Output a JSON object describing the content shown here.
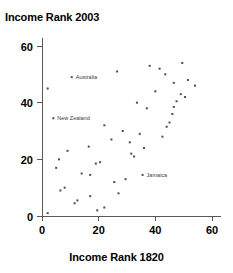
{
  "chart_data": {
    "type": "scatter",
    "title": "",
    "ylabel": "Income Rank 2003",
    "xlabel": "Income Rank 1820",
    "xlim": [
      -3,
      63
    ],
    "ylim": [
      -3,
      63
    ],
    "xticks": [
      0,
      20,
      40,
      60
    ],
    "yticks": [
      0,
      20,
      40,
      60
    ],
    "xtick_labels": [
      "0",
      "20",
      "40",
      "60"
    ],
    "ytick_labels": [
      "0",
      "20",
      "40",
      "60"
    ],
    "grid": false,
    "legend": "none",
    "points": [
      {
        "x": 2.0,
        "y": 45.0,
        "label": ""
      },
      {
        "x": 2.0,
        "y": 1.0,
        "label": ""
      },
      {
        "x": 4.0,
        "y": 34.5,
        "label": "New Zealand"
      },
      {
        "x": 5.0,
        "y": 17.0,
        "label": ""
      },
      {
        "x": 6.0,
        "y": 20.0,
        "label": ""
      },
      {
        "x": 6.5,
        "y": 9.0,
        "label": ""
      },
      {
        "x": 8.0,
        "y": 10.0,
        "label": ""
      },
      {
        "x": 9.0,
        "y": 23.0,
        "label": ""
      },
      {
        "x": 10.5,
        "y": 49.0,
        "label": "Australia"
      },
      {
        "x": 11.5,
        "y": 4.5,
        "label": ""
      },
      {
        "x": 12.5,
        "y": 5.5,
        "label": ""
      },
      {
        "x": 14.0,
        "y": 15.0,
        "label": ""
      },
      {
        "x": 16.5,
        "y": 24.5,
        "label": ""
      },
      {
        "x": 17.0,
        "y": 14.5,
        "label": ""
      },
      {
        "x": 17.0,
        "y": 7.0,
        "label": ""
      },
      {
        "x": 19.0,
        "y": 18.5,
        "label": ""
      },
      {
        "x": 19.5,
        "y": 2.0,
        "label": ""
      },
      {
        "x": 20.5,
        "y": 19.0,
        "label": ""
      },
      {
        "x": 22.0,
        "y": 32.0,
        "label": ""
      },
      {
        "x": 22.0,
        "y": 3.0,
        "label": ""
      },
      {
        "x": 24.5,
        "y": 27.0,
        "label": ""
      },
      {
        "x": 25.5,
        "y": 12.0,
        "label": ""
      },
      {
        "x": 26.5,
        "y": 51.0,
        "label": ""
      },
      {
        "x": 27.0,
        "y": 8.0,
        "label": ""
      },
      {
        "x": 28.5,
        "y": 30.0,
        "label": ""
      },
      {
        "x": 29.5,
        "y": 13.0,
        "label": ""
      },
      {
        "x": 31.0,
        "y": 26.0,
        "label": ""
      },
      {
        "x": 31.5,
        "y": 22.0,
        "label": ""
      },
      {
        "x": 32.5,
        "y": 21.0,
        "label": ""
      },
      {
        "x": 33.5,
        "y": 40.0,
        "label": ""
      },
      {
        "x": 34.5,
        "y": 29.0,
        "label": ""
      },
      {
        "x": 35.5,
        "y": 14.5,
        "label": "Jamaica"
      },
      {
        "x": 36.0,
        "y": 24.0,
        "label": ""
      },
      {
        "x": 37.0,
        "y": 38.0,
        "label": ""
      },
      {
        "x": 38.0,
        "y": 53.0,
        "label": ""
      },
      {
        "x": 40.0,
        "y": 44.0,
        "label": ""
      },
      {
        "x": 41.5,
        "y": 52.0,
        "label": ""
      },
      {
        "x": 42.5,
        "y": 28.0,
        "label": ""
      },
      {
        "x": 43.5,
        "y": 50.0,
        "label": ""
      },
      {
        "x": 44.0,
        "y": 31.5,
        "label": ""
      },
      {
        "x": 45.0,
        "y": 33.0,
        "label": ""
      },
      {
        "x": 46.0,
        "y": 36.0,
        "label": ""
      },
      {
        "x": 46.5,
        "y": 38.5,
        "label": ""
      },
      {
        "x": 46.5,
        "y": 47.0,
        "label": ""
      },
      {
        "x": 47.5,
        "y": 40.5,
        "label": ""
      },
      {
        "x": 49.0,
        "y": 43.0,
        "label": ""
      },
      {
        "x": 49.5,
        "y": 54.0,
        "label": ""
      },
      {
        "x": 50.5,
        "y": 42.0,
        "label": ""
      },
      {
        "x": 51.5,
        "y": 48.0,
        "label": ""
      },
      {
        "x": 54.0,
        "y": 46.0,
        "label": ""
      }
    ]
  }
}
